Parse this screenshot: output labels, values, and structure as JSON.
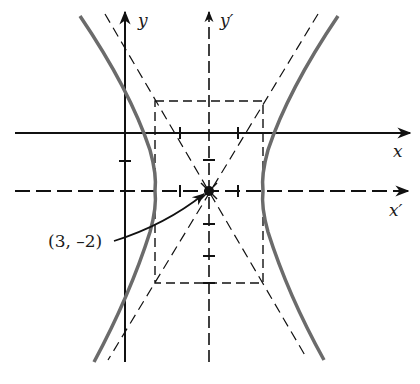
{
  "diagram": {
    "type": "hyperbola-translated-axes",
    "colors": {
      "ink": "#111111",
      "curve": "#6b6b6b",
      "background": "#ffffff"
    },
    "labels": {
      "x_axis": "x",
      "y_axis": "y",
      "x_prime_axis": "x′",
      "y_prime_axis": "y′",
      "center_point": "(3, –2)"
    },
    "center": {
      "x": 3,
      "y": -2
    },
    "elements": [
      "original x-axis (solid, arrow right)",
      "original y-axis (solid, arrow up)",
      "translated x′-axis (dashed, arrow right)",
      "translated y′-axis (dashed, arrow up)",
      "dashed fundamental rectangle",
      "two dashed asymptotes through center",
      "two hyperbola branches opening left and right",
      "pointer arrow from label to center"
    ]
  }
}
